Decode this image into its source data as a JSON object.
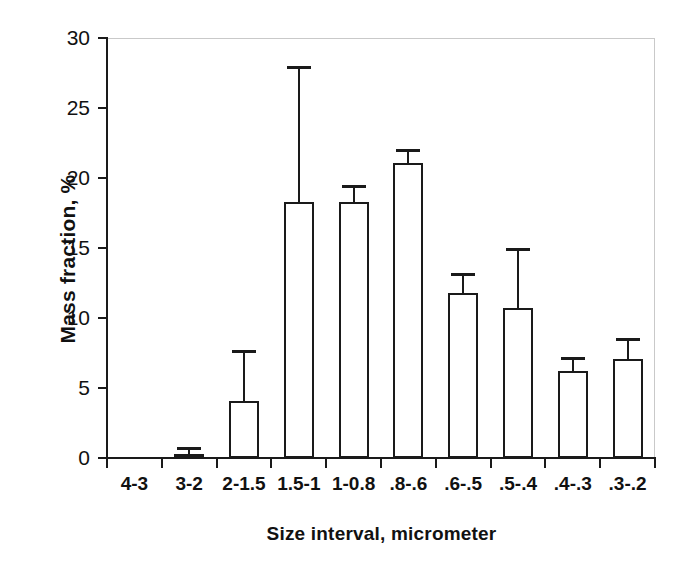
{
  "chart_data": {
    "type": "bar",
    "title": "",
    "xlabel": "Size interval, micrometer",
    "ylabel": "Mass fraction, %",
    "categories": [
      "4-3",
      "3-2",
      "2-1.5",
      "1.5-1",
      "1-0.8",
      ".8-.6",
      ".6-.5",
      ".5-.4",
      ".4-.3",
      ".3-.2"
    ],
    "values": [
      0.05,
      0.3,
      4.1,
      18.3,
      18.3,
      21.1,
      11.8,
      10.7,
      6.2,
      7.1
    ],
    "errors_upper": [
      0.0,
      0.5,
      3.6,
      9.7,
      1.2,
      1.0,
      1.4,
      4.3,
      1.0,
      1.5
    ],
    "error_tops": [
      0.05,
      0.8,
      7.7,
      28.0,
      19.5,
      22.1,
      13.2,
      15.0,
      7.2,
      8.6
    ],
    "ylim": [
      0,
      30
    ],
    "yticks": [
      0,
      5,
      10,
      15,
      20,
      25,
      30
    ],
    "ytick_labels": [
      "0",
      "5",
      "10",
      "15",
      "20",
      "25",
      "30"
    ],
    "grid": false,
    "legend": "none",
    "bar_style": "open-outline",
    "colors": {
      "bar_fill": "#ffffff",
      "bar_edge": "#1a1a1a",
      "axis": "#1a1a1a",
      "frame": "#c9c9c9",
      "text": "#111111"
    }
  }
}
